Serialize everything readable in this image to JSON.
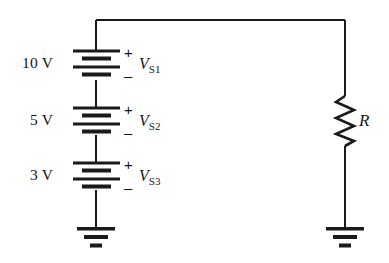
{
  "diagram": {
    "line_color": "#1a1a1a",
    "text_color": "#161616",
    "background": "#ffffff"
  },
  "sources": [
    {
      "value_label": "10 V",
      "name_letter": "V",
      "name_subscript": "S1",
      "plus_sign": "+",
      "minus_sign": "–"
    },
    {
      "value_label": "5 V",
      "name_letter": "V",
      "name_subscript": "S2",
      "plus_sign": "+",
      "minus_sign": "–"
    },
    {
      "value_label": "3 V",
      "name_letter": "V",
      "name_subscript": "S3",
      "plus_sign": "+",
      "minus_sign": "–"
    }
  ],
  "resistor": {
    "label": "R"
  },
  "grounds": [
    {
      "name": "left-ground"
    },
    {
      "name": "right-ground"
    }
  ]
}
